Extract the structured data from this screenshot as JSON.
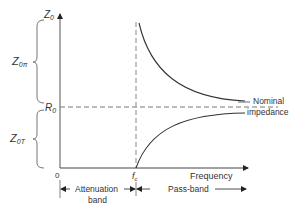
{
  "diagram": {
    "y_axis": {
      "top_label": "Z",
      "top_label_sub": "0",
      "reference_label": "R",
      "reference_label_sub": "0"
    },
    "x_axis": {
      "label": "Frequency",
      "origin_label": "0",
      "cutoff_label": "f",
      "cutoff_label_sub": "c"
    },
    "braces": {
      "upper": {
        "label": "Z",
        "sub": "0π"
      },
      "lower": {
        "label": "Z",
        "sub": "0T"
      }
    },
    "annotations": {
      "nominal_line1": "Nominal",
      "nominal_line2": "impedance",
      "attenuation_line1": "Attenuation",
      "attenuation_line2": "band",
      "pass_band": "Pass-band"
    },
    "colors": {
      "line": "#333333",
      "dashed": "#777777",
      "axis": "#555555"
    }
  }
}
